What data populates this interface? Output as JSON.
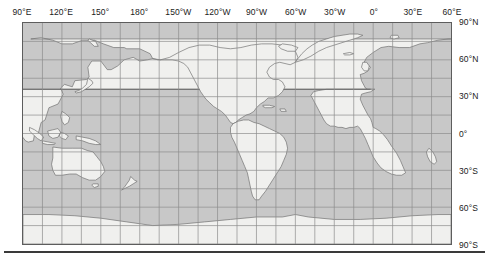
{
  "map": {
    "title": "World Map",
    "projection": "equirectangular",
    "center_longitude": 180,
    "colors": {
      "ocean": "#c8c8c8",
      "land": "#f0f0ee",
      "coastline": "#6a6a6a",
      "graticule": "#8c8c8c",
      "frame": "#5d5d5d",
      "label": "#1b1b1b",
      "rule": "#3a3a3a"
    },
    "frame": {
      "left": 22,
      "top": 22,
      "width": 430,
      "height": 223
    },
    "graticule": {
      "longitude_interval_deg": 15,
      "latitude_interval_deg": 15,
      "label_interval_deg": 30,
      "visible": true
    },
    "longitude_axis": {
      "position": "top",
      "range_deg": [
        90,
        420
      ],
      "labels": [
        {
          "text": "90°E",
          "deg": 90
        },
        {
          "text": "120°E",
          "deg": 120
        },
        {
          "text": "150°",
          "deg": 150
        },
        {
          "text": "180°",
          "deg": 180
        },
        {
          "text": "150°W",
          "deg": 210
        },
        {
          "text": "120°W",
          "deg": 240
        },
        {
          "text": "90°W",
          "deg": 270
        },
        {
          "text": "60°W",
          "deg": 300
        },
        {
          "text": "30°W",
          "deg": 330
        },
        {
          "text": "0°",
          "deg": 360
        },
        {
          "text": "30°E",
          "deg": 390
        },
        {
          "text": "60°E",
          "deg": 420
        }
      ]
    },
    "latitude_axis": {
      "position": "right",
      "range_deg": [
        -90,
        90
      ],
      "labels": [
        {
          "text": "90°N",
          "deg": 90
        },
        {
          "text": "60°N",
          "deg": 60
        },
        {
          "text": "30°N",
          "deg": 30
        },
        {
          "text": "0°",
          "deg": 0
        },
        {
          "text": "30°S",
          "deg": -30
        },
        {
          "text": "60°S",
          "deg": -60
        },
        {
          "text": "90°S",
          "deg": -90
        }
      ]
    }
  }
}
